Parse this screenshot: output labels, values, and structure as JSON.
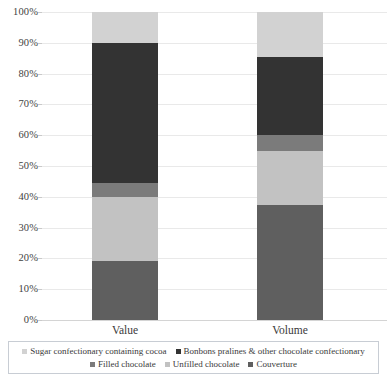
{
  "chart_data": {
    "type": "bar",
    "stacked": true,
    "normalized_percent": true,
    "title": "",
    "subtitle": "",
    "xlabel": "",
    "ylabel": "",
    "categories": [
      "Value",
      "Volume"
    ],
    "ylim": [
      0,
      100
    ],
    "ytick_labels": [
      "0%",
      "10%",
      "20%",
      "30%",
      "40%",
      "50%",
      "60%",
      "70%",
      "80%",
      "90%",
      "100%"
    ],
    "ytick_values": [
      0,
      10,
      20,
      30,
      40,
      50,
      60,
      70,
      80,
      90,
      100
    ],
    "grid": true,
    "grid_axis": "y",
    "legend_position": "bottom",
    "series": [
      {
        "name": "Couverture",
        "color": "#5f5f5f",
        "values": [
          19,
          37.5
        ]
      },
      {
        "name": "Unfilled chocolate",
        "color": "#c2c2c2",
        "values": [
          21,
          17.5
        ]
      },
      {
        "name": "Filled chocolate",
        "color": "#7b7b7b",
        "values": [
          4.5,
          5
        ]
      },
      {
        "name": "Bonbons pralines & other chocolate confectionary",
        "color": "#333333",
        "values": [
          45.5,
          25.5
        ]
      },
      {
        "name": "Sugar confectionary containing cocoa",
        "color": "#d2d2d2",
        "values": [
          10,
          14.5
        ]
      }
    ]
  },
  "legend": {
    "rows": [
      [
        {
          "label": "Sugar confectionary containing cocoa",
          "color": "#d2d2d2"
        },
        {
          "label": "Bonbons pralines & other chocolate confectionary",
          "color": "#333333"
        }
      ],
      [
        {
          "label": "Filled chocolate",
          "color": "#7b7b7b"
        },
        {
          "label": "Unfilled chocolate",
          "color": "#c2c2c2"
        },
        {
          "label": "Couverture",
          "color": "#5f5f5f"
        }
      ]
    ]
  },
  "colors": {
    "gridline": "#e9e9e9",
    "axis_line": "#d4d4d4",
    "legend_border": "#c8cdd4",
    "text": "#3a3a3a",
    "background": "#ffffff"
  }
}
